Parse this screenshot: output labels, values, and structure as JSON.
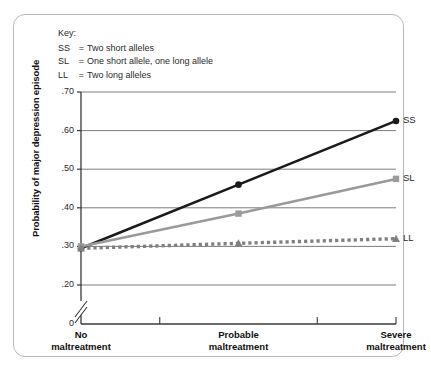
{
  "key": {
    "title": "Key:",
    "entries": [
      {
        "code": "SS",
        "eq": "=",
        "desc": "Two short alleles"
      },
      {
        "code": "SL",
        "eq": "=",
        "desc": "One short allele, one long allele"
      },
      {
        "code": "LL",
        "eq": "=",
        "desc": "Two long alleles"
      }
    ]
  },
  "chart_data": {
    "type": "line",
    "title": "",
    "xlabel": "",
    "ylabel": "Probability of major depression episode",
    "categories": [
      "No maltreatment",
      "Probable maltreatment",
      "Severe maltreatment"
    ],
    "category_lines": [
      [
        "No",
        "maltreatment"
      ],
      [
        "Probable",
        "maltreatment"
      ],
      [
        "Severe",
        "maltreatment"
      ]
    ],
    "series": [
      {
        "name": "SS",
        "label": "SS",
        "values": [
          0.295,
          0.46,
          0.625
        ],
        "color": "#1a1a1a",
        "style": "solid",
        "marker": "circle"
      },
      {
        "name": "SL",
        "label": "SL",
        "values": [
          0.3,
          0.385,
          0.475
        ],
        "color": "#9a9a9a",
        "style": "solid",
        "marker": "square"
      },
      {
        "name": "LL",
        "label": "LL",
        "values": [
          0.295,
          0.308,
          0.32
        ],
        "color": "#808080",
        "style": "dotted",
        "marker": "triangle"
      }
    ],
    "ylim": [
      0.15,
      0.7
    ],
    "yticks": [
      0.7,
      0.6,
      0.5,
      0.4,
      0.3,
      0.2
    ],
    "ytick_labels": [
      ".70",
      ".60",
      ".50",
      ".40",
      ".30",
      ".20"
    ],
    "y_origin_label": "0",
    "axis_break": true,
    "grid": true,
    "legend_position": "right-of-series-ends"
  },
  "colors": {
    "ss": "#1a1a1a",
    "sl": "#9a9a9a",
    "ll": "#808080",
    "grid": "#6e6e6e",
    "axis": "#3a3a3a",
    "card_border": "#b9b9b9"
  }
}
